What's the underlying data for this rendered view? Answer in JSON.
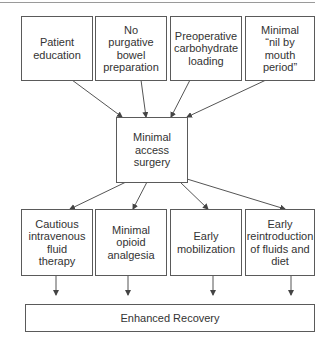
{
  "diagram": {
    "inputs": [
      {
        "label": "Patient\neducation"
      },
      {
        "label": "No\npurgative\nbowel\npreparation"
      },
      {
        "label": "Preoperative\ncarbohydrate\nloading"
      },
      {
        "label": "Minimal\n“nil by\nmouth\nperiod”"
      }
    ],
    "center": {
      "label": "Minimal\naccess\nsurgery"
    },
    "outputs": [
      {
        "label": "Cautious\nintravenous\nfluid\ntherapy"
      },
      {
        "label": "Minimal\nopioid\nanalgesia"
      },
      {
        "label": "Early\nmobilization"
      },
      {
        "label": "Early\nreintroduction\nof fluids and\ndiet"
      }
    ],
    "result": {
      "label": "Enhanced Recovery"
    },
    "colors": {
      "line": "#5a5a5a",
      "text": "#333333"
    }
  }
}
